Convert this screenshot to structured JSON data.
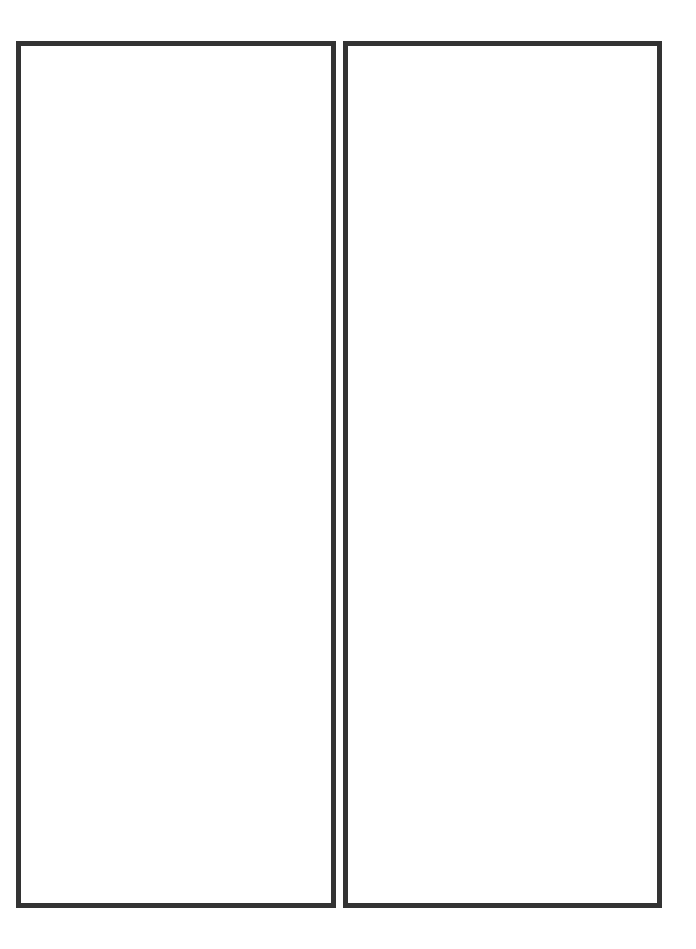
{
  "page": {
    "background": "#ffffff",
    "panels": [
      {
        "id": "left",
        "content": "",
        "border_color": "#333333"
      },
      {
        "id": "right",
        "content": "",
        "border_color": "#333333"
      }
    ]
  }
}
